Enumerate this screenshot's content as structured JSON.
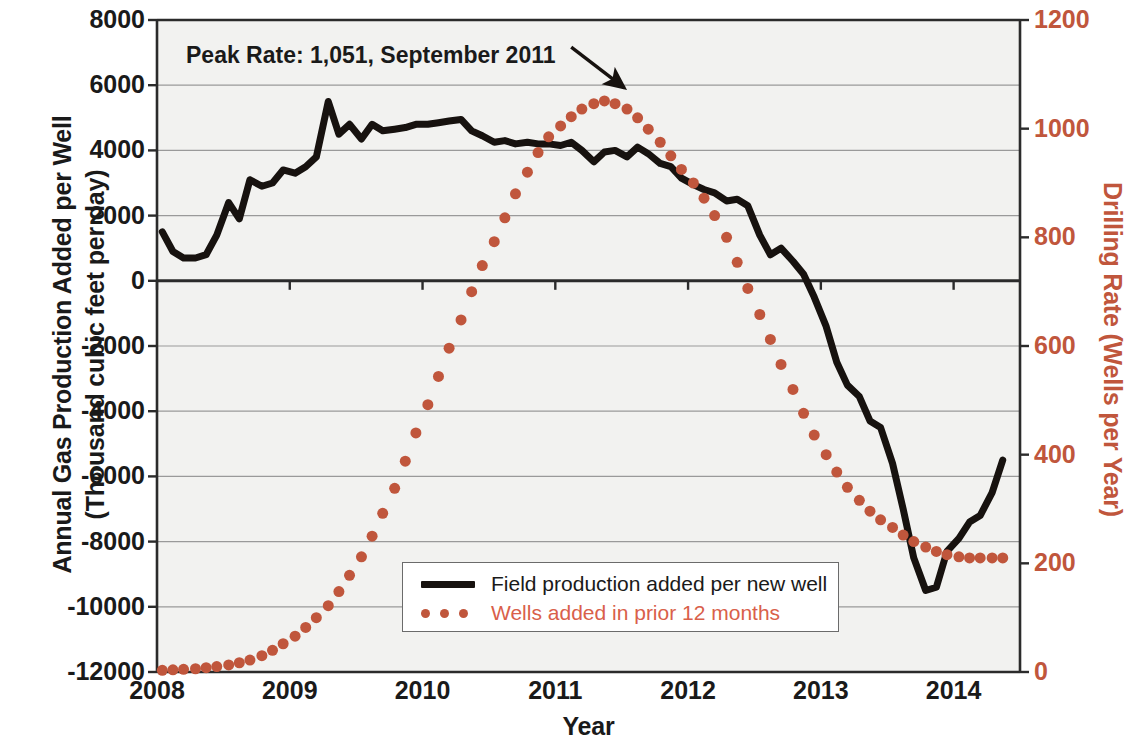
{
  "chart_data": {
    "type": "line",
    "title": "",
    "xlabel": "Year",
    "ylabel_left_line1": "Annual Gas Production Added per Well",
    "ylabel_left_line2": "(Thousand cubic feet per day)",
    "ylabel_right": "Drilling Rate (Wells per Year)",
    "xlim": [
      2008.0,
      2014.5
    ],
    "ylim_left": [
      -12000,
      8000
    ],
    "ylim_right": [
      0,
      1200
    ],
    "grid": true,
    "legend_position": "inside-bottom-center",
    "xticks": [
      "2008",
      "2009",
      "2010",
      "2011",
      "2012",
      "2013",
      "2014"
    ],
    "xtick_values": [
      2008,
      2009,
      2010,
      2011,
      2012,
      2013,
      2014
    ],
    "yticks_left": [
      "8000",
      "6000",
      "4000",
      "2000",
      "0",
      "-2000",
      "-4000",
      "-6000",
      "-8000",
      "-10000",
      "-12000"
    ],
    "ytick_values_left": [
      8000,
      6000,
      4000,
      2000,
      0,
      -2000,
      -4000,
      -6000,
      -8000,
      -10000,
      -12000
    ],
    "yticks_right": [
      "1200",
      "1000",
      "800",
      "600",
      "400",
      "200",
      "0"
    ],
    "ytick_values_right": [
      1200,
      1000,
      800,
      600,
      400,
      200,
      0
    ],
    "annotations": [
      {
        "text": "Peak Rate: 1,051, September 2011",
        "value": 1051,
        "date": "September 2011",
        "arrow_from_x": 2011.12,
        "arrow_from_y_right": 1150,
        "arrow_to_x": 2011.52,
        "arrow_to_y_right": 1075
      }
    ],
    "series": [
      {
        "name": "Field production added per new well",
        "label": "Field production added per new well",
        "axis": "left",
        "color": "#17120f",
        "style": "solid",
        "linewidth": 7,
        "x": [
          2008.04,
          2008.12,
          2008.2,
          2008.29,
          2008.37,
          2008.45,
          2008.54,
          2008.62,
          2008.7,
          2008.79,
          2008.87,
          2008.95,
          2009.04,
          2009.12,
          2009.2,
          2009.29,
          2009.37,
          2009.45,
          2009.54,
          2009.62,
          2009.7,
          2009.79,
          2009.87,
          2009.95,
          2010.04,
          2010.12,
          2010.2,
          2010.29,
          2010.37,
          2010.45,
          2010.54,
          2010.62,
          2010.7,
          2010.79,
          2010.87,
          2010.95,
          2011.04,
          2011.12,
          2011.2,
          2011.29,
          2011.37,
          2011.45,
          2011.54,
          2011.62,
          2011.7,
          2011.79,
          2011.87,
          2011.95,
          2012.04,
          2012.12,
          2012.2,
          2012.29,
          2012.37,
          2012.45,
          2012.54,
          2012.62,
          2012.7,
          2012.79,
          2012.87,
          2012.95,
          2013.04,
          2013.12,
          2013.2,
          2013.29,
          2013.37,
          2013.45,
          2013.54,
          2013.62,
          2013.7,
          2013.79,
          2013.87,
          2013.95,
          2014.04,
          2014.12,
          2014.2,
          2014.29,
          2014.37
        ],
        "values": [
          1500,
          900,
          700,
          700,
          800,
          1400,
          2400,
          1900,
          3100,
          2900,
          3000,
          3400,
          3300,
          3500,
          3800,
          5500,
          4500,
          4800,
          4350,
          4800,
          4600,
          4650,
          4700,
          4800,
          4800,
          4850,
          4900,
          4950,
          4600,
          4450,
          4250,
          4300,
          4200,
          4250,
          4200,
          4200,
          4150,
          4250,
          4000,
          3650,
          3950,
          4000,
          3800,
          4100,
          3900,
          3600,
          3500,
          3150,
          2950,
          2800,
          2700,
          2450,
          2500,
          2300,
          1400,
          800,
          1000,
          600,
          200,
          -500,
          -1400,
          -2500,
          -3200,
          -3550,
          -4300,
          -4500,
          -5600,
          -7000,
          -8500,
          -9500,
          -9400,
          -8300,
          -7900,
          -7400,
          -7200,
          -6500,
          -5500
        ]
      },
      {
        "name": "Wells added in prior 12 months",
        "label": "Wells added in prior 12 months",
        "axis": "right",
        "color": "#c0563c",
        "style": "dotted",
        "markersize": 11,
        "x": [
          2008.04,
          2008.12,
          2008.2,
          2008.29,
          2008.37,
          2008.45,
          2008.54,
          2008.62,
          2008.7,
          2008.79,
          2008.87,
          2008.95,
          2009.04,
          2009.12,
          2009.2,
          2009.29,
          2009.37,
          2009.45,
          2009.54,
          2009.62,
          2009.7,
          2009.79,
          2009.87,
          2009.95,
          2010.04,
          2010.12,
          2010.2,
          2010.29,
          2010.37,
          2010.45,
          2010.54,
          2010.62,
          2010.7,
          2010.79,
          2010.87,
          2010.95,
          2011.04,
          2011.12,
          2011.2,
          2011.29,
          2011.37,
          2011.45,
          2011.54,
          2011.62,
          2011.7,
          2011.79,
          2011.87,
          2011.95,
          2012.04,
          2012.12,
          2012.2,
          2012.29,
          2012.37,
          2012.45,
          2012.54,
          2012.62,
          2012.7,
          2012.79,
          2012.87,
          2012.95,
          2013.04,
          2013.12,
          2013.2,
          2013.29,
          2013.37,
          2013.45,
          2013.54,
          2013.62,
          2013.7,
          2013.79,
          2013.87,
          2013.95,
          2014.04,
          2014.12,
          2014.2,
          2014.29,
          2014.37
        ],
        "values": [
          3,
          4,
          5,
          6,
          8,
          10,
          13,
          17,
          22,
          30,
          40,
          52,
          66,
          82,
          100,
          122,
          148,
          178,
          212,
          250,
          292,
          338,
          388,
          440,
          492,
          544,
          596,
          648,
          700,
          748,
          792,
          836,
          880,
          920,
          956,
          985,
          1005,
          1022,
          1036,
          1046,
          1051,
          1046,
          1036,
          1020,
          999,
          975,
          950,
          925,
          900,
          872,
          840,
          800,
          754,
          706,
          658,
          612,
          566,
          520,
          476,
          436,
          400,
          368,
          340,
          316,
          296,
          280,
          266,
          252,
          240,
          230,
          222,
          216,
          212,
          210,
          210,
          210,
          210
        ]
      }
    ]
  },
  "axis": {
    "left_title_line1": "Annual Gas Production Added per Well",
    "left_title_line2": "(Thousand cubic feet per day)",
    "right_title": "Drilling Rate (Wells per Year)",
    "x_title": "Year"
  },
  "annotation": {
    "peak_text": "Peak Rate: 1,051, September 2011"
  },
  "legend": {
    "items": [
      {
        "label": "Field production added per new well",
        "style": "solid",
        "color": "#17120f"
      },
      {
        "label": "Wells added in prior 12 months",
        "style": "dotted",
        "color": "#d9604a"
      }
    ]
  },
  "colors": {
    "series_black": "#17120f",
    "series_red": "#c0563c",
    "right_axis_text": "#c0563c",
    "plot_background": "#f2f2f0",
    "gridline": "#9a9a9a"
  }
}
